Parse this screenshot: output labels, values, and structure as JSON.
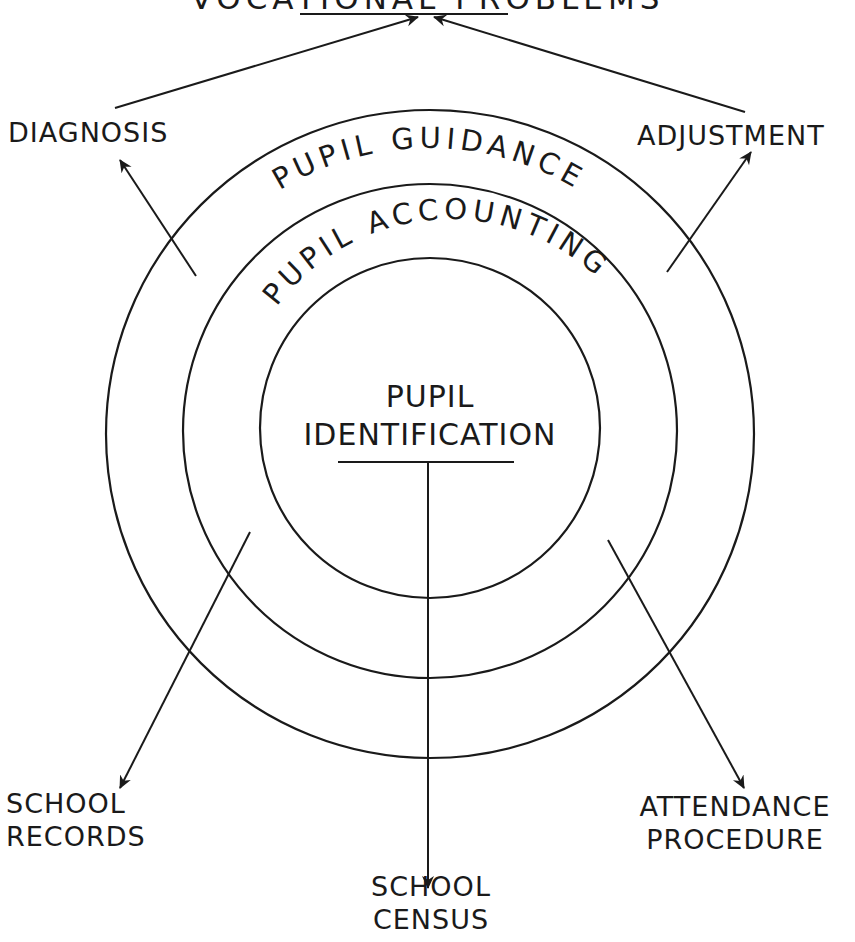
{
  "diagram": {
    "title_partial": "VOCATIONAL PROBLEMS",
    "rings": [
      {
        "name": "inner",
        "label_line1": "PUPIL",
        "label_line2": "IDENTIFICATION"
      },
      {
        "name": "middle",
        "label": "PUPIL ACCOUNTING"
      },
      {
        "name": "outer",
        "label": "PUPIL GUIDANCE"
      }
    ],
    "outputs": {
      "diagnosis": "DIAGNOSIS",
      "adjustment": "ADJUSTMENT",
      "school_records_line1": "SCHOOL",
      "school_records_line2": "RECORDS",
      "school_census_line1": "SCHOOL",
      "school_census_line2": "CENSUS",
      "attendance_line1": "ATTENDANCE",
      "attendance_line2": "PROCEDURE"
    },
    "colors": {
      "ink": "#1a1a1a",
      "paper": "#ffffff"
    }
  }
}
